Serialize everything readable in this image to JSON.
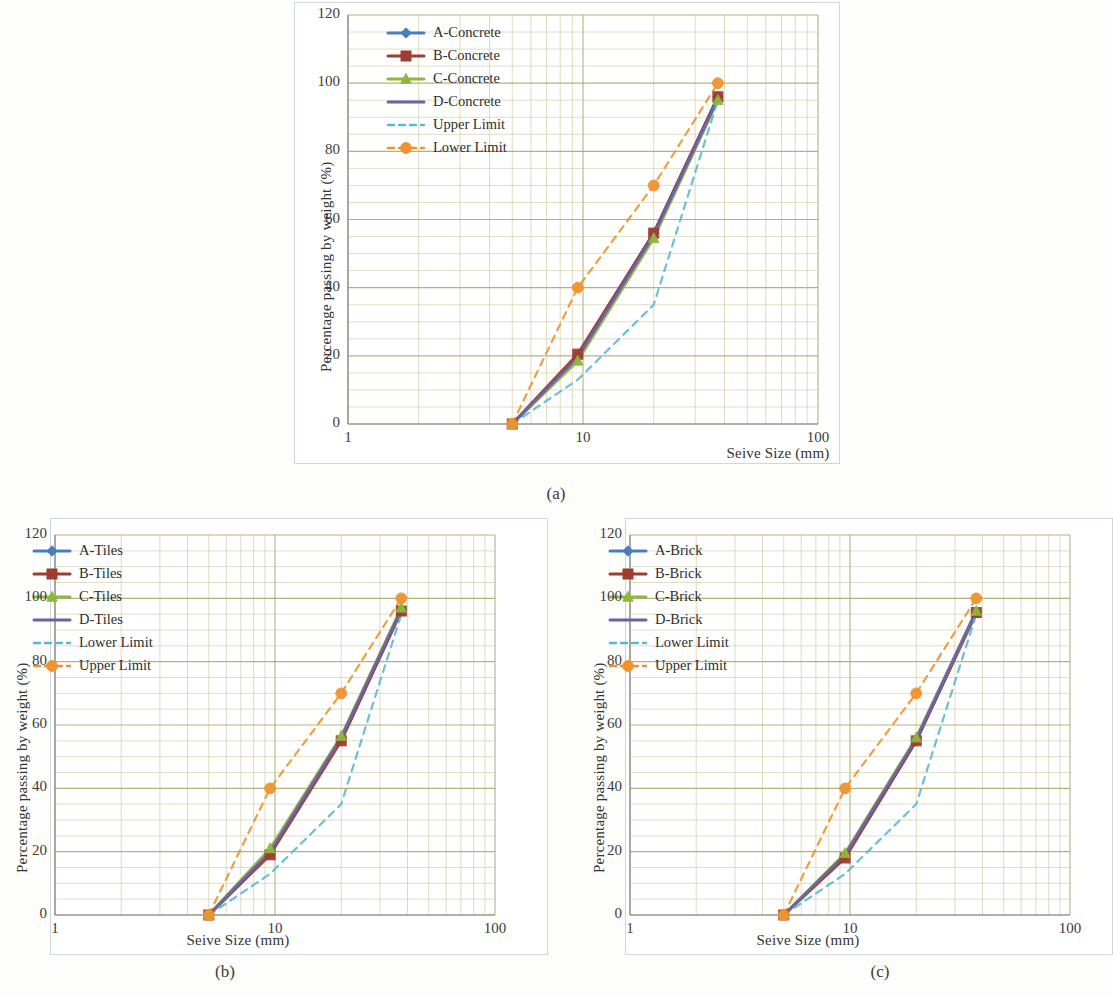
{
  "figure": {
    "captions": [
      "(a)",
      "(b)",
      "(c)"
    ]
  },
  "axes": {
    "xlabel": "Seive Size (mm)",
    "ylabel": "Percentage passing by weight (%)",
    "xticks": [
      "1",
      "10",
      "100"
    ],
    "yticks": [
      "0",
      "20",
      "40",
      "60",
      "80",
      "100",
      "120"
    ]
  },
  "colors": {
    "A": "#4a7ebb",
    "B": "#9e3d32",
    "C": "#8db83c",
    "D": "#6a5fa8",
    "upper_limit": "#5bb8d4",
    "lower_limit": "#f0932f",
    "grid_major": "#b3ac77",
    "grid_minor": "#cfc9a0",
    "axis": "#8a8a8a"
  },
  "chart_data": [
    {
      "type": "line",
      "panel": "(a)",
      "title": "",
      "xlabel": "Seive Size (mm)",
      "ylabel": "Percentage passing by weight (%)",
      "xscale": "log",
      "xlim": [
        1,
        100
      ],
      "ylim": [
        0,
        120
      ],
      "xticks": [
        1,
        10,
        100
      ],
      "yticks": [
        0,
        20,
        40,
        60,
        80,
        100,
        120
      ],
      "grid": true,
      "legend_position": "upper-left-inside",
      "legend": [
        "A-Concrete",
        "B-Concrete",
        "C-Concrete",
        "D-Concrete",
        "Upper Limit",
        "Lower Limit"
      ],
      "x": [
        5,
        9.5,
        20,
        37.5
      ],
      "series": [
        {
          "name": "A-Concrete",
          "marker": "diamond",
          "color": "#4a7ebb",
          "values": [
            0,
            20,
            56,
            96
          ]
        },
        {
          "name": "B-Concrete",
          "marker": "square",
          "color": "#9e3d32",
          "values": [
            0,
            20.5,
            56,
            96
          ]
        },
        {
          "name": "C-Concrete",
          "marker": "triangle",
          "color": "#8db83c",
          "values": [
            0,
            18.5,
            54.5,
            95
          ]
        },
        {
          "name": "D-Concrete",
          "marker": "line",
          "color": "#6a5fa8",
          "values": [
            0,
            19.5,
            55.5,
            95.5
          ]
        },
        {
          "name": "Upper Limit",
          "marker": "dash",
          "color": "#5bb8d4",
          "values": [
            0,
            13,
            35,
            95
          ]
        },
        {
          "name": "Lower Limit",
          "marker": "circle",
          "color": "#f0932f",
          "values": [
            0,
            40,
            70,
            100
          ]
        }
      ]
    },
    {
      "type": "line",
      "panel": "(b)",
      "title": "",
      "xlabel": "Seive Size (mm)",
      "ylabel": "Percentage passing by weight (%)",
      "xscale": "log",
      "xlim": [
        1,
        100
      ],
      "ylim": [
        0,
        120
      ],
      "xticks": [
        1,
        10,
        100
      ],
      "yticks": [
        0,
        20,
        40,
        60,
        80,
        100,
        120
      ],
      "grid": true,
      "legend_position": "upper-left-inside",
      "legend": [
        "A-Tiles",
        "B-Tiles",
        "C-Tiles",
        "D-Tiles",
        "Lower Limit",
        "Upper Limit"
      ],
      "x": [
        5,
        9.5,
        20,
        37.5
      ],
      "series": [
        {
          "name": "A-Tiles",
          "marker": "diamond",
          "color": "#4a7ebb",
          "values": [
            0,
            19.5,
            55.5,
            96
          ]
        },
        {
          "name": "B-Tiles",
          "marker": "square",
          "color": "#9e3d32",
          "values": [
            0,
            19,
            55,
            96
          ]
        },
        {
          "name": "C-Tiles",
          "marker": "triangle",
          "color": "#8db83c",
          "values": [
            0,
            21,
            56.5,
            97
          ]
        },
        {
          "name": "D-Tiles",
          "marker": "line",
          "color": "#6a5fa8",
          "values": [
            0,
            20,
            56,
            96.5
          ]
        },
        {
          "name": "Lower Limit",
          "marker": "dash",
          "color": "#5bb8d4",
          "values": [
            0,
            13,
            35,
            95
          ]
        },
        {
          "name": "Upper Limit",
          "marker": "circle",
          "color": "#f0932f",
          "values": [
            0,
            40,
            70,
            100
          ]
        }
      ]
    },
    {
      "type": "line",
      "panel": "(c)",
      "title": "",
      "xlabel": "Seive Size (mm)",
      "ylabel": "Percentage passing by weight (%)",
      "xscale": "log",
      "xlim": [
        1,
        100
      ],
      "ylim": [
        0,
        120
      ],
      "xticks": [
        1,
        10,
        100
      ],
      "yticks": [
        0,
        20,
        40,
        60,
        80,
        100,
        120
      ],
      "grid": true,
      "legend_position": "upper-left-inside",
      "legend": [
        "A-Brick",
        "B-Brick",
        "C-Brick",
        "D-Brick",
        "Lower Limit",
        "Upper Limit"
      ],
      "x": [
        5,
        9.5,
        20,
        37.5
      ],
      "series": [
        {
          "name": "A-Brick",
          "marker": "diamond",
          "color": "#4a7ebb",
          "values": [
            0,
            18.5,
            55,
            95.5
          ]
        },
        {
          "name": "B-Brick",
          "marker": "square",
          "color": "#9e3d32",
          "values": [
            0,
            18,
            55,
            95.5
          ]
        },
        {
          "name": "C-Brick",
          "marker": "triangle",
          "color": "#8db83c",
          "values": [
            0,
            19.5,
            56,
            96
          ]
        },
        {
          "name": "D-Brick",
          "marker": "line",
          "color": "#6a5fa8",
          "values": [
            0,
            19,
            55.5,
            96
          ]
        },
        {
          "name": "Lower Limit",
          "marker": "dash",
          "color": "#5bb8d4",
          "values": [
            0,
            13,
            35,
            95
          ]
        },
        {
          "name": "Upper Limit",
          "marker": "circle",
          "color": "#f0932f",
          "values": [
            0,
            40,
            70,
            100
          ]
        }
      ]
    }
  ]
}
